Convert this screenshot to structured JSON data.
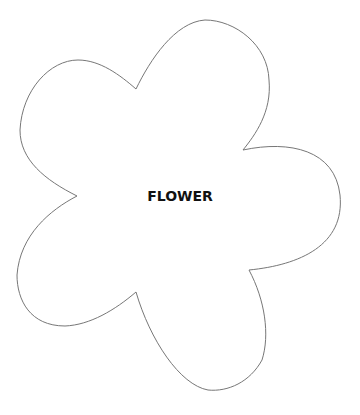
{
  "shape": {
    "type": "flower",
    "petals": 5,
    "stroke_color": "#777777",
    "fill_color": "#ffffff",
    "label": "FLOWER"
  }
}
